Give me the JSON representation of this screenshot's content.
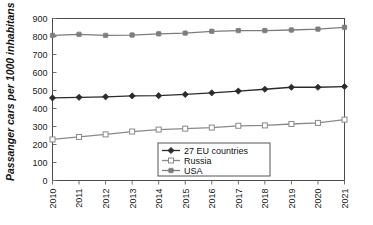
{
  "chart_data": {
    "type": "line",
    "title": "",
    "xlabel": "",
    "ylabel": "Passanger cars per 1000 inhabitans",
    "x": [
      2010,
      2011,
      2012,
      2013,
      2014,
      2015,
      2016,
      2017,
      2018,
      2019,
      2020,
      2021
    ],
    "categories": [
      "2010",
      "2011",
      "2012",
      "2013",
      "2014",
      "2015",
      "2016",
      "2017",
      "2018",
      "2019",
      "2020",
      "2021"
    ],
    "ylim": [
      0,
      900
    ],
    "yticks": [
      0,
      100,
      200,
      300,
      400,
      500,
      600,
      700,
      800,
      900
    ],
    "ytick_labels": [
      "0",
      "100",
      "200",
      "300",
      "400",
      "500",
      "600",
      "700",
      "800",
      "900"
    ],
    "grid": false,
    "legend_position": "inside-bottom-center",
    "series": [
      {
        "name": "27 EU countries",
        "color": "#2b2b2b",
        "marker": "filled-diamond",
        "values": [
          459,
          462,
          465,
          470,
          471,
          478,
          487,
          497,
          507,
          518,
          518,
          522
        ]
      },
      {
        "name": "Russia",
        "color": "#8a8a8a",
        "marker": "open-square",
        "values": [
          228,
          242,
          256,
          272,
          283,
          288,
          294,
          304,
          306,
          314,
          320,
          338
        ]
      },
      {
        "name": "USA",
        "color": "#7d7d7d",
        "marker": "filled-square",
        "values": [
          806,
          812,
          806,
          808,
          815,
          819,
          829,
          833,
          833,
          836,
          841,
          851
        ]
      }
    ]
  },
  "axes": {
    "y_axis_title": "Passanger cars per 1000 inhabitans"
  },
  "legend": {
    "items": [
      {
        "label": "27 EU countries"
      },
      {
        "label": "Russia"
      },
      {
        "label": "USA"
      }
    ]
  },
  "colors": {
    "eu": "#2b2b2b",
    "russia": "#8a8a8a",
    "usa": "#7d7d7d",
    "frame": "#4a4a4a",
    "background": "#ffffff"
  }
}
